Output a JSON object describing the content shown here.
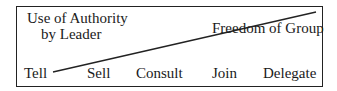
{
  "diagram": {
    "type": "continuum-of-leadership-behavior",
    "left_axis_label": [
      "Use of Authority",
      "by Leader"
    ],
    "right_axis_label": "Freedom of Group",
    "scale_points": [
      {
        "label": "Tell",
        "x": 24
      },
      {
        "label": "Sell",
        "x": 87
      },
      {
        "label": "Consult",
        "x": 136
      },
      {
        "label": "Join",
        "x": 212
      },
      {
        "label": "Delegate",
        "x": 263
      }
    ],
    "divider_line": {
      "from": [
        53,
        72
      ],
      "to": [
        316,
        12
      ]
    },
    "colors": {
      "ink": "#1a1a1a",
      "background": "#ffffff"
    }
  }
}
